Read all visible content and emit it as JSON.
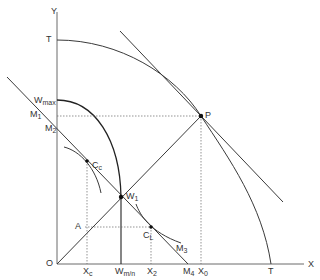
{
  "diagram": {
    "type": "economics-production-possibility",
    "colors": {
      "line": "#3a3a3a",
      "dotted": "#666666",
      "background": "#ffffff"
    },
    "axes": {
      "x_label": "X",
      "y_label": "Y",
      "origin_label": "O"
    },
    "curves": {
      "transformation_curve": {
        "label_top": "T",
        "label_bottom": "T"
      },
      "tangent_line": {
        "point_label": "P"
      },
      "ray_45": {
        "from": "O",
        "to": "P"
      },
      "budget_line": {
        "labels": [
          "M1",
          "M2",
          "M3",
          "M4"
        ]
      },
      "welfare_curve": {
        "top_label": "W",
        "top_sub": "max",
        "bottom_label": "W",
        "bottom_sub": "m/n"
      }
    },
    "points": [
      {
        "name": "P",
        "label": "P"
      },
      {
        "name": "W1",
        "label": "W",
        "sub": "1"
      },
      {
        "name": "Cc",
        "label": "C",
        "sub": "c"
      },
      {
        "name": "CL",
        "label": "C",
        "sub": "L"
      },
      {
        "name": "A",
        "label": "A"
      }
    ],
    "labels": {
      "y": "Y",
      "x": "X",
      "o": "O",
      "t_top": "T",
      "t_bottom": "T",
      "w_max": "W",
      "w_max_sub": "max",
      "m1": "M",
      "m1_sub": "1",
      "m2": "M",
      "m2_sub": "2",
      "m3": "M",
      "m3_sub": "3",
      "m4": "M",
      "m4_sub": "4",
      "p": "P",
      "cc": "C",
      "cc_sub": "c",
      "w1": "W",
      "w1_sub": "1",
      "cl": "C",
      "cl_sub": "L",
      "a": "A",
      "xc": "X",
      "xc_sub": "c",
      "wmn": "W",
      "wmn_sub": "m/n",
      "x2": "X",
      "x2_sub": "2",
      "x0": "X",
      "x0_sub": "0"
    }
  }
}
